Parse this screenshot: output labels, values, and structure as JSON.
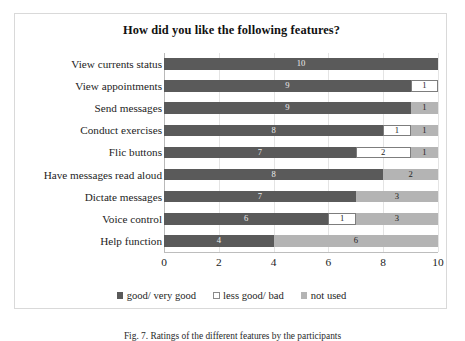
{
  "chart_data": {
    "type": "bar",
    "orientation": "horizontal",
    "stacked": true,
    "title": "How did you like the following features?",
    "xlabel": "",
    "ylabel": "",
    "xlim": [
      0,
      10
    ],
    "xticks": [
      0,
      2,
      4,
      6,
      8,
      10
    ],
    "grid": true,
    "legend_position": "bottom",
    "categories": [
      "View currents status",
      "View appointments",
      "Send messages",
      "Conduct exercises",
      "Flic buttons",
      "Have messages read aloud",
      "Dictate messages",
      "Voice control",
      "Help function"
    ],
    "series": [
      {
        "name": "good/ very good",
        "color": "#5a5a5a",
        "values": [
          10,
          9,
          9,
          8,
          7,
          8,
          7,
          6,
          4
        ]
      },
      {
        "name": "less good/ bad",
        "color": "#ffffff",
        "values": [
          0,
          1,
          0,
          1,
          2,
          0,
          0,
          1,
          0
        ]
      },
      {
        "name": "not used",
        "color": "#b4b4b4",
        "values": [
          0,
          0,
          1,
          1,
          1,
          2,
          3,
          3,
          6
        ]
      }
    ],
    "data_labels": [
      [
        {
          "series": "good/ very good",
          "text": "10"
        }
      ],
      [
        {
          "series": "good/ very good",
          "text": "9"
        },
        {
          "series": "less good/ bad",
          "text": "1"
        }
      ],
      [
        {
          "series": "good/ very good",
          "text": "9"
        },
        {
          "series": "not used",
          "text": "1"
        }
      ],
      [
        {
          "series": "good/ very good",
          "text": "8"
        },
        {
          "series": "less good/ bad",
          "text": "1"
        },
        {
          "series": "not used",
          "text": "1"
        }
      ],
      [
        {
          "series": "good/ very good",
          "text": "7"
        },
        {
          "series": "less good/ bad",
          "text": "2"
        },
        {
          "series": "not used",
          "text": "1"
        }
      ],
      [
        {
          "series": "good/ very good",
          "text": "8"
        },
        {
          "series": "not used",
          "text": "2"
        }
      ],
      [
        {
          "series": "good/ very good",
          "text": "7"
        },
        {
          "series": "not used",
          "text": "3"
        }
      ],
      [
        {
          "series": "good/ very good",
          "text": "6"
        },
        {
          "series": "less good/ bad",
          "text": "1"
        },
        {
          "series": "not used",
          "text": "3"
        }
      ],
      [
        {
          "series": "good/ very good",
          "text": "4"
        },
        {
          "series": "not used",
          "text": "6"
        }
      ]
    ]
  },
  "caption": "Fig. 7. Ratings of the different features by the participants"
}
